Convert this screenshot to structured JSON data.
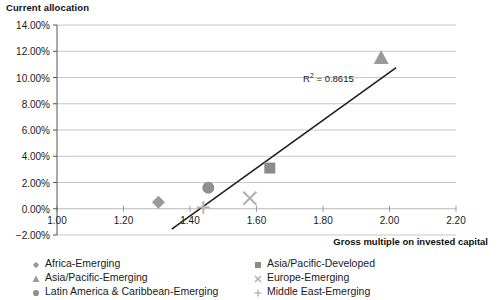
{
  "chart_data": {
    "type": "scatter",
    "title": "Current allocation",
    "xlabel": "Gross multiple on invested capital",
    "ylabel": "Current allocation",
    "xlim": [
      1.0,
      2.2
    ],
    "ylim": [
      -0.02,
      0.14
    ],
    "grid": true,
    "legend_position": "bottom",
    "x_ticks": [
      "1.00",
      "1.20",
      "1.40",
      "1.60",
      "1.80",
      "2.00",
      "2.20"
    ],
    "x_tick_values": [
      1.0,
      1.2,
      1.4,
      1.6,
      1.8,
      2.0,
      2.2
    ],
    "y_ticks": [
      "-2.00%",
      "0.00%",
      "2.00%",
      "4.00%",
      "6.00%",
      "8.00%",
      "10.00%",
      "12.00%",
      "14.00%"
    ],
    "y_tick_values": [
      -0.02,
      0.0,
      0.02,
      0.04,
      0.06,
      0.08,
      0.1,
      0.12,
      0.14
    ],
    "annotations": [
      {
        "text": "R² = 0.8615",
        "r2": 0.8615,
        "x": 1.74,
        "y": 0.0995
      }
    ],
    "trendline": {
      "x0": 1.345,
      "y0": -0.0155,
      "x1": 2.02,
      "y1": 0.1075
    },
    "series": [
      {
        "name": "Africa-Emerging",
        "marker": "diamond",
        "color": "#9a9a9a",
        "x": 1.305,
        "y": 0.005
      },
      {
        "name": "Asia/Pacific-Developed",
        "marker": "square",
        "color": "#8c8c8c",
        "x": 1.64,
        "y": 0.031
      },
      {
        "name": "Asia/Pacific-Emerging",
        "marker": "triangle",
        "color": "#9a9a9a",
        "x": 1.975,
        "y": 0.115
      },
      {
        "name": "Europe-Emerging",
        "marker": "x",
        "color": "#b0b0b0",
        "x": 1.58,
        "y": 0.008
      },
      {
        "name": "Latin America & Caribbean-Emerging",
        "marker": "circle",
        "color": "#8f8f8f",
        "x": 1.455,
        "y": 0.016
      },
      {
        "name": "Middle East-Emerging",
        "marker": "plus",
        "color": "#b5b5b5",
        "x": 1.44,
        "y": 0.001
      }
    ]
  },
  "legend": {
    "columns": [
      [
        {
          "label": "Africa-Emerging",
          "marker": "diamond",
          "color": "#9a9a9a"
        },
        {
          "label": "Asia/Pacific-Emerging",
          "marker": "triangle",
          "color": "#9a9a9a"
        },
        {
          "label": "Latin America & Caribbean-Emerging",
          "marker": "circle",
          "color": "#8f8f8f"
        }
      ],
      [
        {
          "label": "Asia/Pacific-Developed",
          "marker": "square",
          "color": "#8c8c8c"
        },
        {
          "label": "Europe-Emerging",
          "marker": "x",
          "color": "#b0b0b0"
        },
        {
          "label": "Middle East-Emerging",
          "marker": "plus",
          "color": "#b5b5b5"
        }
      ]
    ]
  },
  "colors": {
    "axis": "#555555",
    "grid": "#c8c8c8",
    "trendline": "#1f1f1f",
    "text": "#1a1a1a"
  }
}
